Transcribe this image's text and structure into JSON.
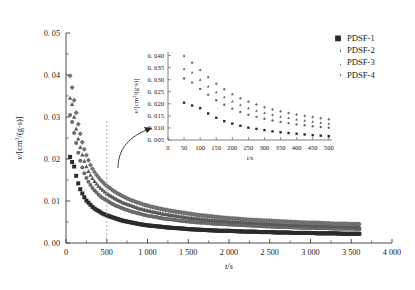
{
  "chart_data": {
    "type": "scatter",
    "title": "",
    "xlabel": "t/s",
    "ylabel": "v/[cm3/(g·s)]",
    "ylabel_parts": {
      "symbol": "v",
      "slash": "/[cm",
      "sup": "3",
      "rest": "/(g·s)]"
    },
    "xlim": [
      0,
      4000
    ],
    "ylim": [
      0,
      0.05
    ],
    "grid": false,
    "legend_position": "top-right",
    "xticks": [
      0,
      500,
      1000,
      1500,
      2000,
      2500,
      3000,
      3500,
      4000
    ],
    "xticklabels": [
      "0",
      "500",
      "1 000",
      "1 500",
      "2 000",
      "2 500",
      "3 000",
      "3 500",
      "4 000"
    ],
    "yticks": [
      0,
      0.01,
      0.02,
      0.03,
      0.04,
      0.05
    ],
    "yticklabels": [
      "0. 00",
      "0. 01",
      "0. 02",
      "0. 03",
      "0. 04",
      "0. 05"
    ],
    "annotations": [
      {
        "name": "inset-callout-line",
        "type": "vertical-dashed",
        "x": 500
      },
      {
        "name": "inset-callout-arrow",
        "type": "curved-arrow",
        "from_x": 500,
        "to": "inset"
      }
    ],
    "series": [
      {
        "name": "PDSF-1",
        "marker": "square",
        "color": "#2b2b2b",
        "points": [
          [
            50,
            0.0205
          ],
          [
            75,
            0.0193
          ],
          [
            100,
            0.0182
          ],
          [
            125,
            0.016
          ],
          [
            150,
            0.0142
          ],
          [
            175,
            0.0128
          ],
          [
            200,
            0.0118
          ],
          [
            225,
            0.0109
          ],
          [
            250,
            0.0101
          ],
          [
            275,
            0.0096
          ],
          [
            300,
            0.0091
          ],
          [
            325,
            0.0086
          ],
          [
            350,
            0.0082
          ],
          [
            375,
            0.0079
          ],
          [
            400,
            0.0076
          ],
          [
            425,
            0.0073
          ],
          [
            450,
            0.007
          ],
          [
            475,
            0.0068
          ],
          [
            500,
            0.0066
          ],
          [
            600,
            0.0059
          ],
          [
            700,
            0.0053
          ],
          [
            800,
            0.0049
          ],
          [
            900,
            0.0045
          ],
          [
            1000,
            0.0042
          ],
          [
            1100,
            0.004
          ],
          [
            1200,
            0.0038
          ],
          [
            1300,
            0.0036
          ],
          [
            1400,
            0.0035
          ],
          [
            1500,
            0.0033
          ],
          [
            1600,
            0.0032
          ],
          [
            1700,
            0.0031
          ],
          [
            1800,
            0.003
          ],
          [
            1900,
            0.0029
          ],
          [
            2000,
            0.0029
          ],
          [
            2100,
            0.0028
          ],
          [
            2200,
            0.0027
          ],
          [
            2300,
            0.0027
          ],
          [
            2400,
            0.0026
          ],
          [
            2500,
            0.0026
          ],
          [
            2600,
            0.0025
          ],
          [
            2700,
            0.0025
          ],
          [
            2800,
            0.0024
          ],
          [
            2900,
            0.0024
          ],
          [
            3000,
            0.0024
          ],
          [
            3100,
            0.0023
          ],
          [
            3200,
            0.0023
          ],
          [
            3300,
            0.0023
          ],
          [
            3400,
            0.0022
          ],
          [
            3500,
            0.0022
          ],
          [
            3600,
            0.0022
          ]
        ]
      },
      {
        "name": "PDSF-2",
        "marker": "circle",
        "color": "#6a6a6a",
        "points": [
          [
            50,
            0.0305
          ],
          [
            75,
            0.0288
          ],
          [
            100,
            0.0262
          ],
          [
            125,
            0.0238
          ],
          [
            150,
            0.0215
          ],
          [
            175,
            0.0196
          ],
          [
            200,
            0.018
          ],
          [
            225,
            0.0166
          ],
          [
            250,
            0.0155
          ],
          [
            275,
            0.0146
          ],
          [
            300,
            0.0138
          ],
          [
            325,
            0.0131
          ],
          [
            350,
            0.0125
          ],
          [
            375,
            0.012
          ],
          [
            400,
            0.0115
          ],
          [
            425,
            0.0111
          ],
          [
            450,
            0.0107
          ],
          [
            475,
            0.0104
          ],
          [
            500,
            0.0101
          ],
          [
            600,
            0.009
          ],
          [
            700,
            0.0082
          ],
          [
            800,
            0.0075
          ],
          [
            900,
            0.007
          ],
          [
            1000,
            0.0065
          ],
          [
            1100,
            0.0062
          ],
          [
            1200,
            0.0058
          ],
          [
            1300,
            0.0056
          ],
          [
            1400,
            0.0053
          ],
          [
            1500,
            0.0051
          ],
          [
            1600,
            0.0049
          ],
          [
            1700,
            0.0048
          ],
          [
            1800,
            0.0046
          ],
          [
            1900,
            0.0045
          ],
          [
            2000,
            0.0044
          ],
          [
            2100,
            0.0043
          ],
          [
            2200,
            0.0042
          ],
          [
            2300,
            0.0041
          ],
          [
            2400,
            0.004
          ],
          [
            2500,
            0.0039
          ],
          [
            2600,
            0.0038
          ],
          [
            2700,
            0.0038
          ],
          [
            2800,
            0.0037
          ],
          [
            2900,
            0.0036
          ],
          [
            3000,
            0.0036
          ],
          [
            3100,
            0.0035
          ],
          [
            3200,
            0.0035
          ],
          [
            3300,
            0.0034
          ],
          [
            3400,
            0.0034
          ],
          [
            3500,
            0.0034
          ],
          [
            3600,
            0.0033
          ]
        ]
      },
      {
        "name": "PDSF-3",
        "marker": "triangle",
        "color": "#5a5a5a",
        "points": [
          [
            50,
            0.0345
          ],
          [
            75,
            0.033
          ],
          [
            100,
            0.03
          ],
          [
            125,
            0.0272
          ],
          [
            150,
            0.0248
          ],
          [
            175,
            0.0228
          ],
          [
            200,
            0.021
          ],
          [
            225,
            0.0195
          ],
          [
            250,
            0.0182
          ],
          [
            275,
            0.0171
          ],
          [
            300,
            0.0162
          ],
          [
            325,
            0.0154
          ],
          [
            350,
            0.0147
          ],
          [
            375,
            0.0141
          ],
          [
            400,
            0.0135
          ],
          [
            425,
            0.013
          ],
          [
            450,
            0.0126
          ],
          [
            475,
            0.0122
          ],
          [
            500,
            0.0118
          ],
          [
            600,
            0.0106
          ],
          [
            700,
            0.0096
          ],
          [
            800,
            0.0089
          ],
          [
            900,
            0.0082
          ],
          [
            1000,
            0.0077
          ],
          [
            1100,
            0.0073
          ],
          [
            1200,
            0.0069
          ],
          [
            1300,
            0.0066
          ],
          [
            1400,
            0.0063
          ],
          [
            1500,
            0.006
          ],
          [
            1600,
            0.0058
          ],
          [
            1700,
            0.0056
          ],
          [
            1800,
            0.0054
          ],
          [
            1900,
            0.0053
          ],
          [
            2000,
            0.0051
          ],
          [
            2100,
            0.005
          ],
          [
            2200,
            0.0049
          ],
          [
            2300,
            0.0048
          ],
          [
            2400,
            0.0047
          ],
          [
            2500,
            0.0046
          ],
          [
            2600,
            0.0045
          ],
          [
            2700,
            0.0044
          ],
          [
            2800,
            0.0043
          ],
          [
            2900,
            0.0043
          ],
          [
            3000,
            0.0042
          ],
          [
            3100,
            0.0041
          ],
          [
            3200,
            0.0041
          ],
          [
            3300,
            0.004
          ],
          [
            3400,
            0.004
          ],
          [
            3500,
            0.0039
          ],
          [
            3600,
            0.0039
          ]
        ]
      },
      {
        "name": "PDSF-4",
        "marker": "diamond",
        "color": "#707070",
        "points": [
          [
            50,
            0.0398
          ],
          [
            75,
            0.037
          ],
          [
            100,
            0.034
          ],
          [
            125,
            0.031
          ],
          [
            150,
            0.0283
          ],
          [
            175,
            0.026
          ],
          [
            200,
            0.024
          ],
          [
            225,
            0.0223
          ],
          [
            250,
            0.0209
          ],
          [
            275,
            0.0197
          ],
          [
            300,
            0.0186
          ],
          [
            325,
            0.0177
          ],
          [
            350,
            0.0169
          ],
          [
            375,
            0.0162
          ],
          [
            400,
            0.0156
          ],
          [
            425,
            0.015
          ],
          [
            450,
            0.0145
          ],
          [
            475,
            0.014
          ],
          [
            500,
            0.0136
          ],
          [
            600,
            0.0122
          ],
          [
            700,
            0.0111
          ],
          [
            800,
            0.0102
          ],
          [
            900,
            0.0095
          ],
          [
            1000,
            0.0089
          ],
          [
            1100,
            0.0084
          ],
          [
            1200,
            0.008
          ],
          [
            1300,
            0.0076
          ],
          [
            1400,
            0.0073
          ],
          [
            1500,
            0.007
          ],
          [
            1600,
            0.0067
          ],
          [
            1700,
            0.0065
          ],
          [
            1800,
            0.0063
          ],
          [
            1900,
            0.0061
          ],
          [
            2000,
            0.0059
          ],
          [
            2100,
            0.0058
          ],
          [
            2200,
            0.0056
          ],
          [
            2300,
            0.0055
          ],
          [
            2400,
            0.0054
          ],
          [
            2500,
            0.0053
          ],
          [
            2600,
            0.0052
          ],
          [
            2700,
            0.0051
          ],
          [
            2800,
            0.005
          ],
          [
            2900,
            0.0049
          ],
          [
            3000,
            0.0048
          ],
          [
            3100,
            0.0048
          ],
          [
            3200,
            0.0047
          ],
          [
            3300,
            0.0046
          ],
          [
            3400,
            0.0046
          ],
          [
            3500,
            0.0045
          ],
          [
            3600,
            0.0045
          ]
        ]
      }
    ],
    "inset": {
      "type": "scatter",
      "xlabel": "t/s",
      "ylabel": "v/[cm3/(g·s)]",
      "ylabel_parts": {
        "symbol": "v",
        "slash": "/[cm",
        "sup": "3",
        "rest": "/(g·s)]"
      },
      "xlim": [
        0,
        510
      ],
      "ylim": [
        0.005,
        0.0415
      ],
      "xticks": [
        0,
        50,
        100,
        150,
        200,
        250,
        300,
        350,
        400,
        450,
        500
      ],
      "xticklabels": [
        "0",
        "50",
        "100",
        "150",
        "200",
        "250",
        "300",
        "350",
        "400",
        "450",
        "500"
      ],
      "yticks": [
        0.005,
        0.01,
        0.015,
        0.02,
        0.025,
        0.03,
        0.035,
        0.04
      ],
      "yticklabels": [
        "0. 005",
        "0. 010",
        "0. 015",
        "0. 020",
        "0. 025",
        "0. 030",
        "0. 035",
        "0. 040"
      ]
    }
  },
  "legend": {
    "items": [
      {
        "label": "PDSF-1",
        "marker": "square",
        "color": "#2b2b2b"
      },
      {
        "label": "PDSF-2",
        "marker": "circle",
        "color": "#6a6a6a"
      },
      {
        "label": "PDSF-3",
        "marker": "triangle",
        "color": "#5a5a5a"
      },
      {
        "label": "PDSF-4",
        "marker": "diamond",
        "color": "#707070"
      }
    ]
  }
}
